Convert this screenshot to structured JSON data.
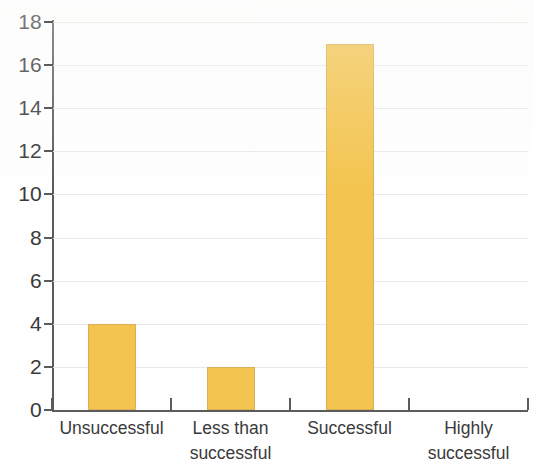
{
  "chart_data": {
    "type": "bar",
    "title": "",
    "subtitle": "",
    "xlabel": "",
    "ylabel": "",
    "categories": [
      "Unsuccessful",
      "Less than successful",
      "Successful",
      "Highly successful"
    ],
    "category_lines": [
      [
        "Unsuccessful"
      ],
      [
        "Less than",
        "successful"
      ],
      [
        "Successful"
      ],
      [
        "Highly",
        "successful"
      ]
    ],
    "values": [
      4,
      2,
      17,
      0
    ],
    "ylim": [
      0,
      18
    ],
    "ytick_values": [
      0,
      2,
      4,
      6,
      8,
      10,
      12,
      14,
      16,
      18
    ],
    "ytick_labels": [
      "0",
      "2",
      "4",
      "6",
      "8",
      "10",
      "12",
      "14",
      "16",
      "18"
    ],
    "grid": true,
    "grid_axis": "y",
    "legend": null,
    "legend_position": "none",
    "bar_color": "#f3c44f",
    "bar_edge_color": "#d9b057",
    "axis_color": "#5b5b5b",
    "grid_color": "#e9e9e9",
    "text_color": "#3a3a3a",
    "annotations": []
  }
}
